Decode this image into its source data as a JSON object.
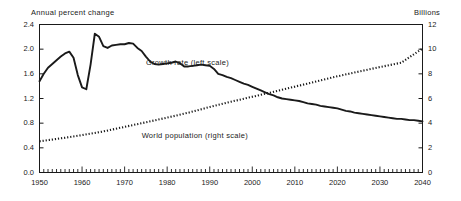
{
  "chart_data": {
    "type": "line",
    "title": "",
    "subtitle": "",
    "xlabel": "",
    "ylabel": "Annual percent change",
    "ylabel_right": "Billions",
    "xlim": [
      1950,
      2040
    ],
    "ylim": [
      0.0,
      2.4
    ],
    "ylim_right": [
      0,
      12
    ],
    "grid": false,
    "legend_position": "inline-annotations",
    "yticks": [
      "2.4",
      "2.0",
      "1.6",
      "1.2",
      "0.8",
      "0.4",
      "0.0"
    ],
    "yticks_right": [
      "12",
      "10",
      "8",
      "6",
      "4",
      "2",
      "0"
    ],
    "xticks": [
      "1950",
      "1960",
      "1970",
      "1980",
      "1990",
      "2000",
      "2010",
      "2020",
      "2030",
      "2040"
    ],
    "xtick_minor_interval": 1,
    "annotations": [
      {
        "text": "Growth rate (left scale)",
        "x": 1975,
        "y": 1.77
      },
      {
        "text": "World population (right scale)",
        "x": 1974,
        "y": 0.6
      }
    ],
    "series": [
      {
        "name": "Growth rate (left scale)",
        "axis": "left",
        "unit": "annual percent change",
        "style": "solid",
        "color": "#1a1a1a",
        "x": [
          1950,
          1951,
          1952,
          1953,
          1954,
          1955,
          1956,
          1957,
          1958,
          1959,
          1960,
          1961,
          1962,
          1963,
          1964,
          1965,
          1966,
          1967,
          1968,
          1969,
          1970,
          1971,
          1972,
          1973,
          1974,
          1975,
          1976,
          1977,
          1978,
          1979,
          1980,
          1981,
          1982,
          1983,
          1984,
          1985,
          1986,
          1987,
          1988,
          1989,
          1990,
          1991,
          1992,
          1993,
          1994,
          1995,
          1996,
          1997,
          1998,
          1999,
          2000,
          2001,
          2002,
          2003,
          2004,
          2005,
          2006,
          2007,
          2008,
          2009,
          2010,
          2011,
          2012,
          2013,
          2014,
          2015,
          2016,
          2017,
          2018,
          2019,
          2020,
          2021,
          2022,
          2023,
          2024,
          2025,
          2026,
          2027,
          2028,
          2029,
          2030,
          2031,
          2032,
          2033,
          2034,
          2035,
          2036,
          2037,
          2038,
          2039,
          2040
        ],
        "values": [
          1.48,
          1.6,
          1.7,
          1.76,
          1.82,
          1.88,
          1.93,
          1.96,
          1.86,
          1.58,
          1.38,
          1.35,
          1.75,
          2.25,
          2.2,
          2.05,
          2.02,
          2.06,
          2.07,
          2.08,
          2.08,
          2.1,
          2.09,
          2.02,
          1.97,
          1.88,
          1.8,
          1.76,
          1.75,
          1.76,
          1.77,
          1.78,
          1.8,
          1.77,
          1.72,
          1.72,
          1.73,
          1.74,
          1.75,
          1.74,
          1.73,
          1.68,
          1.6,
          1.58,
          1.55,
          1.53,
          1.5,
          1.47,
          1.44,
          1.42,
          1.39,
          1.36,
          1.33,
          1.3,
          1.27,
          1.25,
          1.22,
          1.2,
          1.19,
          1.18,
          1.17,
          1.16,
          1.14,
          1.12,
          1.11,
          1.1,
          1.08,
          1.07,
          1.06,
          1.05,
          1.04,
          1.02,
          1.0,
          0.99,
          0.97,
          0.96,
          0.95,
          0.94,
          0.93,
          0.92,
          0.91,
          0.9,
          0.89,
          0.88,
          0.87,
          0.87,
          0.86,
          0.85,
          0.85,
          0.84,
          0.83
        ]
      },
      {
        "name": "World population (right scale)",
        "axis": "right",
        "unit": "billions",
        "style": "dotted",
        "color": "#1a1a1a",
        "x": [
          1950,
          1955,
          1960,
          1965,
          1970,
          1975,
          1980,
          1985,
          1990,
          1995,
          2000,
          2005,
          2010,
          2015,
          2020,
          2025,
          2030,
          2035,
          2040
        ],
        "values": [
          2.53,
          2.77,
          3.03,
          3.33,
          3.7,
          4.07,
          4.45,
          4.85,
          5.31,
          5.74,
          6.14,
          6.54,
          6.96,
          7.38,
          7.8,
          8.18,
          8.55,
          8.9,
          10.05
        ]
      }
    ]
  }
}
